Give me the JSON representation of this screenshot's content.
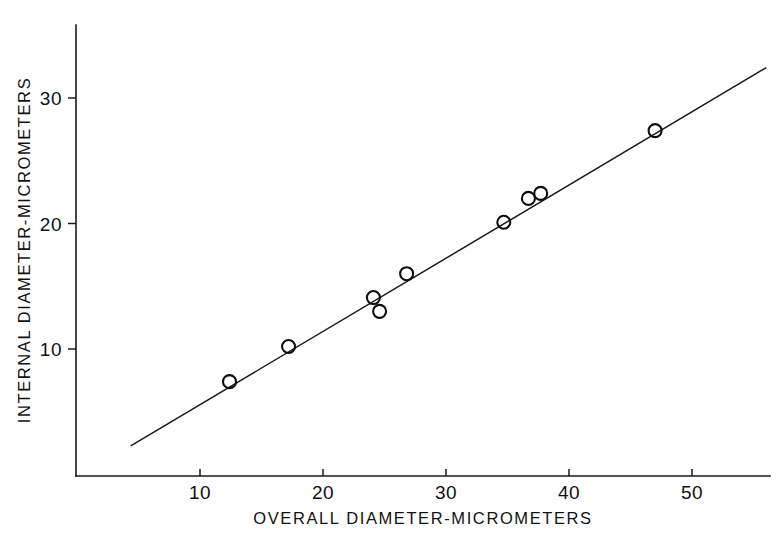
{
  "chart_data": {
    "type": "scatter",
    "title": "",
    "xlabel": "OVERALL DIAMETER-MICROMETERS",
    "ylabel": "INTERNAL DIAMETER-MICROMETERS",
    "xlim": [
      3.0,
      56.5
    ],
    "ylim": [
      1.0,
      35.0
    ],
    "xticks": [
      10,
      20,
      30,
      40,
      50
    ],
    "xticklabels": [
      "10",
      "20",
      "30",
      "40",
      "50"
    ],
    "yticks": [
      10,
      20,
      30
    ],
    "yticklabels": [
      "10",
      "20",
      "30"
    ],
    "grid": false,
    "legend": null,
    "marker": "open-circle",
    "marker_size_px": 13,
    "points": [
      {
        "x": 12.4,
        "y": 7.4
      },
      {
        "x": 17.2,
        "y": 10.2
      },
      {
        "x": 24.1,
        "y": 14.1
      },
      {
        "x": 24.6,
        "y": 13.0
      },
      {
        "x": 26.8,
        "y": 16.0
      },
      {
        "x": 34.7,
        "y": 20.1
      },
      {
        "x": 36.7,
        "y": 22.0
      },
      {
        "x": 37.7,
        "y": 22.4
      },
      {
        "x": 47.0,
        "y": 27.4
      }
    ],
    "series": [
      {
        "name": "measurements",
        "x": [
          12.4,
          17.2,
          24.1,
          24.6,
          26.8,
          34.7,
          36.7,
          37.7,
          47.0
        ],
        "values": [
          7.4,
          10.2,
          14.1,
          13.0,
          16.0,
          20.1,
          22.0,
          22.4,
          27.4
        ]
      }
    ],
    "fit_line": {
      "name": "regression-line",
      "x_start": 4.4,
      "y_start": 2.3,
      "x_end": 56.0,
      "y_end": 32.4
    },
    "axis_style": {
      "spines": [
        "left",
        "bottom"
      ],
      "tick_direction": "out",
      "line_color": "#1a1a1a"
    }
  },
  "colors": {
    "background": "#ffffff",
    "ink": "#111111",
    "marker_stroke": "#0d0d0d",
    "line": "#1a1a1a"
  }
}
